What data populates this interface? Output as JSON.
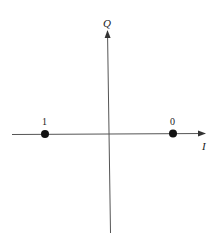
{
  "diagram": {
    "type": "constellation",
    "axes": {
      "horizontal_label": "I",
      "vertical_label": "Q"
    },
    "points": [
      {
        "label": "1",
        "position": "negative-I"
      },
      {
        "label": "0",
        "position": "positive-I"
      }
    ],
    "colors": {
      "axis": "#444444",
      "point": "#111111",
      "text": "#222222"
    }
  }
}
